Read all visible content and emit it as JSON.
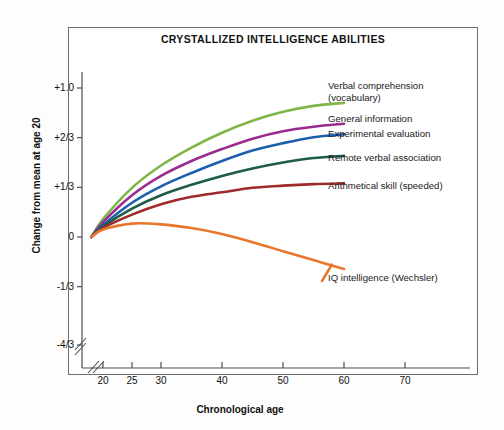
{
  "chart_data": {
    "type": "line",
    "title": "CRYSTALLIZED INTELLIGENCE ABILITIES",
    "xlabel": "Chronological age",
    "ylabel": "Change from mean at age 20",
    "grid": false,
    "legend_position": "inline-right-of-curve-ends",
    "xlim": [
      17,
      78
    ],
    "ylim": [
      -1.333,
      1.18
    ],
    "x_axis_break": true,
    "y_axis_break": true,
    "x_tick_labels": [
      "20",
      "25",
      "30",
      "40",
      "50",
      "60",
      "70"
    ],
    "x_tick_values": [
      20,
      25,
      30,
      40,
      50,
      60,
      70
    ],
    "y_tick_labels": [
      "+1.0",
      "+2/3",
      "+1/3",
      "0",
      "-1/3",
      "-4/3"
    ],
    "y_tick_values": [
      1.0,
      0.6667,
      0.3333,
      0,
      -0.3333,
      -1.3333
    ],
    "x": [
      18,
      20,
      25,
      30,
      35,
      40,
      45,
      50,
      55,
      60
    ],
    "series": [
      {
        "name": "Verbal comprehension (vocabulary)",
        "label": "Verbal comprehension\n(vocabulary)",
        "color": "#7FB647",
        "values": [
          0.0,
          0.12,
          0.33,
          0.48,
          0.6,
          0.7,
          0.78,
          0.84,
          0.88,
          0.9
        ]
      },
      {
        "name": "General information",
        "label": "General information",
        "color": "#9B2B8E",
        "values": [
          0.0,
          0.1,
          0.28,
          0.41,
          0.51,
          0.59,
          0.66,
          0.71,
          0.74,
          0.76
        ]
      },
      {
        "name": "Experimental evaluation",
        "label": "Experimental evaluation",
        "color": "#1C5FAC",
        "values": [
          0.0,
          0.08,
          0.23,
          0.34,
          0.43,
          0.51,
          0.58,
          0.63,
          0.67,
          0.69
        ]
      },
      {
        "name": "Remote verbal association",
        "label": "Remote verbal association",
        "color": "#1E5C48",
        "values": [
          0.0,
          0.07,
          0.19,
          0.28,
          0.35,
          0.41,
          0.46,
          0.5,
          0.53,
          0.545
        ]
      },
      {
        "name": "Arithmetical skill (speeded)",
        "label": "Arithmetical skill (speeded)",
        "color": "#A02A2A",
        "values": [
          0.0,
          0.06,
          0.15,
          0.22,
          0.27,
          0.3,
          0.33,
          0.345,
          0.355,
          0.36
        ]
      },
      {
        "name": "IQ intelligence (Wechsler)",
        "label": "IQ intelligence (Wechsler)",
        "color": "#E8762C",
        "values": [
          0.0,
          0.05,
          0.09,
          0.085,
          0.06,
          0.02,
          -0.035,
          -0.095,
          -0.155,
          -0.215
        ]
      }
    ]
  },
  "axis": {
    "y_title": "Change from mean at age 20",
    "x_title": "Chronological age"
  }
}
